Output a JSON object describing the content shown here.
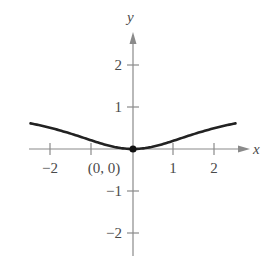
{
  "chart_data": {
    "type": "line",
    "title": "",
    "xlabel": "x",
    "ylabel": "y",
    "xlim": [
      -2.5,
      2.6
    ],
    "ylim": [
      -2.6,
      2.8
    ],
    "grid": false,
    "x_ticks": [
      -2,
      -1,
      1,
      2
    ],
    "x_tick_labels": [
      "−2",
      "",
      "1",
      "2"
    ],
    "y_ticks": [
      2,
      1,
      -1,
      -2
    ],
    "y_tick_labels": [
      "2",
      "1",
      "−1",
      "−2"
    ],
    "annotations": [
      {
        "text": "(0, 0)",
        "x": 0,
        "y": 0
      }
    ],
    "series": [
      {
        "name": "f(x)",
        "x": [
          -2.5,
          -2.0,
          -1.5,
          -1.0,
          -0.5,
          0,
          0.5,
          1.0,
          1.5,
          2.0,
          2.5
        ],
        "values": [
          0.61,
          0.5,
          0.36,
          0.2,
          0.06,
          0,
          0.06,
          0.2,
          0.36,
          0.5,
          0.61
        ]
      }
    ],
    "points": [
      {
        "x": 0,
        "y": 0,
        "marker": "filled-circle"
      }
    ]
  },
  "labels": {
    "x_axis": "x",
    "y_axis": "y",
    "point_label": "(0, 0)",
    "x_tick_neg2": "−2",
    "x_tick_1": "1",
    "x_tick_2": "2",
    "y_tick_2": "2",
    "y_tick_1": "1",
    "y_tick_neg1": "−1",
    "y_tick_neg2": "−2"
  },
  "colors": {
    "axis": "#8a8a8a",
    "curve": "#222222",
    "text": "#4a4a4a"
  }
}
